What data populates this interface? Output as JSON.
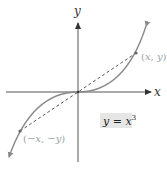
{
  "figure": {
    "axes": {
      "x_label": "x",
      "y_label": "y"
    },
    "curve": {
      "equation_label": {
        "lhs": "y",
        "eq": " = ",
        "base": "x",
        "exponent": "3"
      },
      "color": "#7a7a7a"
    },
    "points": [
      {
        "name": "point-x-y",
        "label_open": "(",
        "label_a": "x",
        "label_sep": ", ",
        "label_b": "y",
        "label_close": ")"
      },
      {
        "name": "point-neg-x-neg-y",
        "label_open": "(",
        "label_a": "−x",
        "label_sep": ", ",
        "label_b": "−y",
        "label_close": ")"
      }
    ],
    "dashed_line": "connects (x, y) and (−x, −y) through the origin",
    "colors": {
      "axis": "#444444",
      "curve": "#7a7a7a",
      "dashed": "#333333",
      "point_label": "#9aa3ad",
      "equation_box": "#e6e6e6"
    }
  }
}
